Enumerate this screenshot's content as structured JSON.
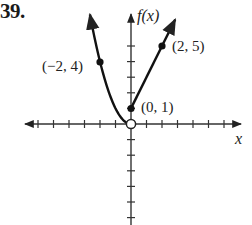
{
  "problem": {
    "number": "39."
  },
  "chart_data": {
    "type": "line",
    "title": "",
    "xlabel": "x",
    "ylabel": "f(x)",
    "xlim": [
      -7,
      7
    ],
    "ylim": [
      -7,
      7
    ],
    "grid": false,
    "x_ticks": [
      -6,
      -5,
      -4,
      -3,
      -2,
      -1,
      1,
      2,
      3,
      4,
      5,
      6
    ],
    "y_ticks": [
      -6,
      -5,
      -4,
      -3,
      -2,
      -1,
      1,
      2,
      3,
      4,
      5
    ],
    "series": [
      {
        "name": "left branch f(x) = x^2, x < 0",
        "domain": [
          -2.6,
          0
        ],
        "points": [
          [
            -2.6,
            6.76
          ],
          [
            -2,
            4
          ],
          [
            -1,
            1
          ],
          [
            0,
            0
          ]
        ],
        "end_at_0": "open circle at (0, 0)"
      },
      {
        "name": "right branch f(x) = 2x + 1, x >= 0",
        "domain": [
          0,
          2.9
        ],
        "points": [
          [
            0,
            1
          ],
          [
            2,
            5
          ],
          [
            2.9,
            6.8
          ]
        ],
        "start_at_0": "closed dot at (0, 1)"
      }
    ],
    "annotations": [
      {
        "text": "(−2, 4)",
        "x": -2,
        "y": 4,
        "marker": "filled"
      },
      {
        "text": "(2, 5)",
        "x": 2,
        "y": 5,
        "marker": "filled"
      },
      {
        "text": "(0, 1)",
        "x": 0,
        "y": 1,
        "marker": "filled"
      },
      {
        "text": "",
        "x": 0,
        "y": 0,
        "marker": "open"
      }
    ]
  },
  "labels": {
    "pt_neg2_4": "(−2, 4)",
    "pt_2_5": "(2, 5)",
    "pt_0_1": "(0, 1)",
    "y_axis": "f(x)",
    "x_axis": "x"
  }
}
